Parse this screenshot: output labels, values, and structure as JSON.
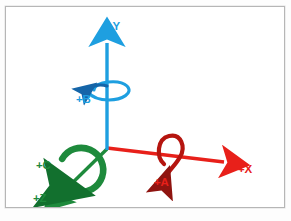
{
  "figure": {
    "kind": "coordinate-axes-diagram",
    "frame": {
      "border_color": "#b6b6b6",
      "background": "#ffffff"
    },
    "caption": ""
  },
  "colors": {
    "x_axis": "#e8201a",
    "x_axis_dark": "#8f1410",
    "y_axis": "#1e9fe0",
    "y_axis_dark": "#1565a8",
    "z_axis": "#1e8a3c",
    "z_axis_dark": "#12702e",
    "frame": "#b6b6b6",
    "background": "#ffffff"
  },
  "labels": {
    "y": "+Y",
    "b": "+B",
    "x": "+X",
    "a": "+A",
    "c": "+C",
    "z": "+Z"
  },
  "axes": [
    {
      "id": "y",
      "label": "+Y",
      "type": "linear",
      "color": "#1e9fe0",
      "direction": "up",
      "origin": [
        105,
        146
      ],
      "tip": [
        105,
        30
      ]
    },
    {
      "id": "x",
      "label": "+X",
      "type": "linear",
      "color": "#e8201a",
      "direction": "right-slightly-down",
      "origin": [
        105,
        146
      ],
      "tip": [
        228,
        161
      ]
    },
    {
      "id": "z",
      "label": "+Z",
      "type": "linear",
      "color": "#1e8a3c",
      "direction": "down-left",
      "origin": [
        105,
        146
      ],
      "tip": [
        52,
        196
      ]
    }
  ],
  "rotary_axes": [
    {
      "id": "b",
      "label": "+B",
      "about": "y",
      "color": "#1e9fe0",
      "center": [
        105,
        85
      ],
      "sense": "counterclockwise-viewed-from-+Y"
    },
    {
      "id": "a",
      "label": "+A",
      "about": "x",
      "color": "#b5150f",
      "center": [
        166,
        153
      ],
      "sense": "counterclockwise-viewed-from-+X"
    },
    {
      "id": "c",
      "label": "+C",
      "about": "z",
      "color": "#1e8a3c",
      "center": [
        81,
        167
      ],
      "sense": "counterclockwise-viewed-from-+Z"
    }
  ]
}
